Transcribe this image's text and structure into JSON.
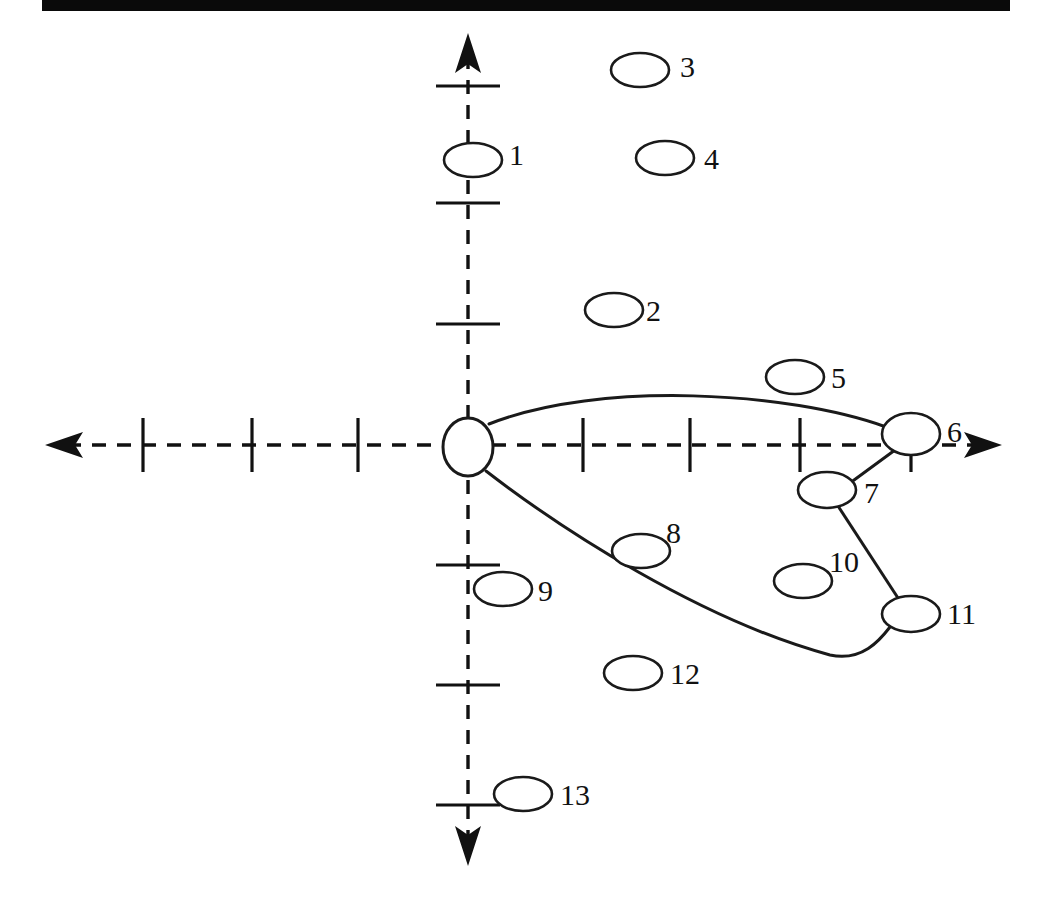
{
  "figure": {
    "title_bar": {
      "present": true,
      "color": "#0a0a0a"
    },
    "background": "#ffffff",
    "stroke_color": "#1a1a1a"
  },
  "chart_data": {
    "type": "diagram",
    "title": "",
    "xlabel": "",
    "ylabel": "",
    "grid": false,
    "legend": false,
    "axes": {
      "x_axis": {
        "y": 445,
        "x_start": 45,
        "x_end": 1002,
        "dashed": true,
        "arrows": [
          "left",
          "right"
        ],
        "ticks": [
          143,
          252,
          358,
          583,
          690,
          800,
          911
        ]
      },
      "y_axis": {
        "x": 468,
        "y_start": 33,
        "y_end": 866,
        "dashed": true,
        "arrows": [
          "up",
          "down"
        ],
        "ticks": [
          86,
          203,
          324,
          565,
          685,
          805
        ]
      },
      "origin": {
        "x": 468,
        "y": 445
      }
    },
    "nodes": [
      {
        "id": "origin",
        "label": "",
        "cx": 468,
        "cy": 447,
        "rx": 25,
        "ry": 29,
        "label_x": 0,
        "label_y": 0
      },
      {
        "id": "1",
        "label": "1",
        "cx": 473,
        "cy": 160,
        "rx": 29,
        "ry": 17,
        "label_x": 509,
        "label_y": 158
      },
      {
        "id": "2",
        "label": "2",
        "cx": 614,
        "cy": 310,
        "rx": 29,
        "ry": 17,
        "label_x": 646,
        "label_y": 314
      },
      {
        "id": "3",
        "label": "3",
        "cx": 640,
        "cy": 70,
        "rx": 29,
        "ry": 17,
        "label_x": 680,
        "label_y": 70
      },
      {
        "id": "4",
        "label": "4",
        "cx": 665,
        "cy": 158,
        "rx": 29,
        "ry": 17,
        "label_x": 704,
        "label_y": 162
      },
      {
        "id": "5",
        "label": "5",
        "cx": 795,
        "cy": 377,
        "rx": 29,
        "ry": 17,
        "label_x": 831,
        "label_y": 381
      },
      {
        "id": "6",
        "label": "6",
        "cx": 911,
        "cy": 434,
        "rx": 29,
        "ry": 21,
        "label_x": 947,
        "label_y": 435
      },
      {
        "id": "7",
        "label": "7",
        "cx": 827,
        "cy": 490,
        "rx": 29,
        "ry": 18,
        "label_x": 864,
        "label_y": 496
      },
      {
        "id": "8",
        "label": "8",
        "cx": 641,
        "cy": 551,
        "rx": 29,
        "ry": 17,
        "label_x": 666,
        "label_y": 536
      },
      {
        "id": "9",
        "label": "9",
        "cx": 503,
        "cy": 589,
        "rx": 29,
        "ry": 17,
        "label_x": 538,
        "label_y": 594
      },
      {
        "id": "10",
        "label": "10",
        "cx": 803,
        "cy": 581,
        "rx": 29,
        "ry": 17,
        "label_x": 829,
        "label_y": 565
      },
      {
        "id": "11",
        "label": "11",
        "cx": 911,
        "cy": 614,
        "rx": 29,
        "ry": 18,
        "label_x": 947,
        "label_y": 617
      },
      {
        "id": "12",
        "label": "12",
        "cx": 633,
        "cy": 673,
        "rx": 29,
        "ry": 17,
        "label_x": 670,
        "label_y": 677
      },
      {
        "id": "13",
        "label": "13",
        "cx": 523,
        "cy": 794,
        "rx": 29,
        "ry": 17,
        "label_x": 560,
        "label_y": 798
      }
    ],
    "edges": [
      {
        "from": "origin",
        "to": "6",
        "kind": "curve",
        "path": "M 489 424 C 600 380 790 392 886 427"
      },
      {
        "from": "origin",
        "to": "11",
        "kind": "curve",
        "path": "M 486 471 C 560 528 700 620 830 655 C 862 662 880 640 890 627"
      },
      {
        "from": "6",
        "to": "7",
        "kind": "line",
        "path": "M 895 450 L 850 483"
      },
      {
        "from": "7",
        "to": "11",
        "kind": "line",
        "path": "M 838 506 L 898 598"
      }
    ],
    "node_count": 13
  }
}
